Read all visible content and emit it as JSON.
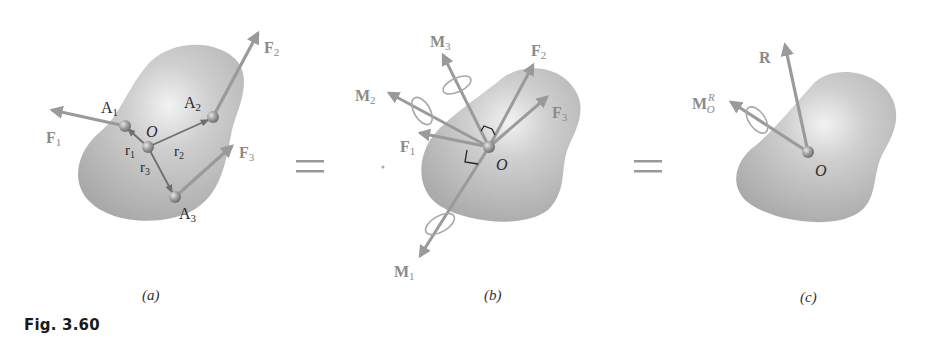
{
  "figure": {
    "label": "Fig. 3.60",
    "equals_sign": "=",
    "panels": [
      {
        "id": "a",
        "caption": "(a)",
        "origin_label": "O",
        "points": [
          {
            "name": "A",
            "sub": "1"
          },
          {
            "name": "A",
            "sub": "2"
          },
          {
            "name": "A",
            "sub": "3"
          }
        ],
        "position_vectors": [
          {
            "name": "r",
            "sub": "1"
          },
          {
            "name": "r",
            "sub": "2"
          },
          {
            "name": "r",
            "sub": "3"
          }
        ],
        "forces": [
          {
            "name": "F",
            "sub": "1"
          },
          {
            "name": "F",
            "sub": "2"
          },
          {
            "name": "F",
            "sub": "3"
          }
        ]
      },
      {
        "id": "b",
        "caption": "(b)",
        "origin_label": "O",
        "forces": [
          {
            "name": "F",
            "sub": "1"
          },
          {
            "name": "F",
            "sub": "2"
          },
          {
            "name": "F",
            "sub": "3"
          }
        ],
        "couples": [
          {
            "name": "M",
            "sub": "1"
          },
          {
            "name": "M",
            "sub": "2"
          },
          {
            "name": "M",
            "sub": "3"
          }
        ]
      },
      {
        "id": "c",
        "caption": "(c)",
        "origin_label": "O",
        "resultant": {
          "name": "R"
        },
        "resultant_moment": {
          "name": "M",
          "sub": "O",
          "sup": "R"
        }
      }
    ],
    "colors": {
      "arrow": "#9a9a9a",
      "vector_dark": "#6e6e6e",
      "body": "#b4b4b4",
      "point": "#8c8c8c"
    }
  }
}
